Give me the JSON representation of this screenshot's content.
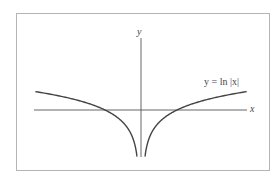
{
  "chart_data": {
    "type": "line",
    "title": "",
    "xlabel": "x",
    "ylabel": "y",
    "series": [
      {
        "name": "y = ln |x|",
        "function": "ln|x|",
        "x_left": [
          -3.0,
          -2.5,
          -2.0,
          -1.5,
          -1.0,
          -0.6,
          -0.3,
          -0.15,
          -0.06
        ],
        "x_right": [
          0.06,
          0.15,
          0.3,
          0.6,
          1.0,
          1.5,
          2.0,
          2.5,
          3.0
        ],
        "y_left": [
          1.1,
          0.92,
          0.69,
          0.41,
          0.0,
          -0.51,
          -1.2,
          -1.9,
          -2.81
        ],
        "y_right": [
          -2.81,
          -1.9,
          -1.2,
          -0.51,
          0.0,
          0.41,
          0.69,
          0.92,
          1.1
        ]
      }
    ],
    "annotations": [
      {
        "text": "y = ln |x|",
        "position": "right branch, upper right"
      }
    ],
    "grid": false,
    "axis_ticks": false,
    "frame": true,
    "xlim": [
      -3.2,
      3.6
    ],
    "ylim": [
      -3.0,
      2.4
    ]
  },
  "labels": {
    "x_axis": "x",
    "y_axis": "y",
    "curve_label": "y = ln |x|"
  },
  "colors": {
    "curve": "#444444",
    "axes": "#555555",
    "frame": "#b5b5b5",
    "background": "#ffffff"
  }
}
